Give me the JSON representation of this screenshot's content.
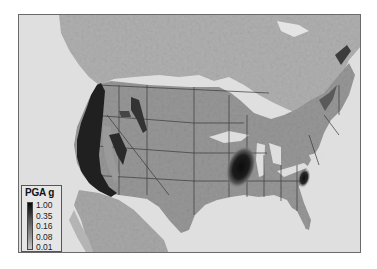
{
  "map": {
    "subject": "Seismic hazard map of the conterminous United States",
    "region": "United States",
    "hotspots": [
      "Pacific coast (California, Oregon, Washington)",
      "Intermountain West (Utah, Idaho, Wyoming)",
      "New Madrid seismic zone",
      "Charleston, South Carolina"
    ],
    "colors": {
      "water": "#dedede",
      "land": "#9a9a9a",
      "canada_mexico": "#b2b2b2",
      "high": "#1a1a1a",
      "mid": "#555555",
      "border": "#3a3a3a"
    }
  },
  "legend": {
    "title": "PGA g",
    "labels": [
      "1.00",
      "0.35",
      "0.16",
      "0.08",
      "0.01"
    ]
  }
}
